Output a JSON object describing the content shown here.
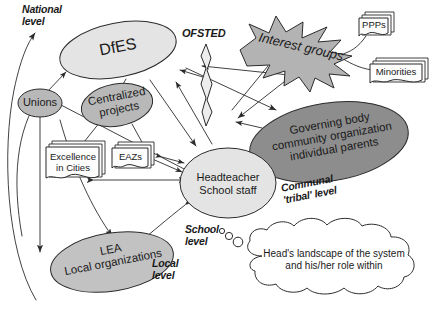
{
  "diagram": {
    "title": "Head's landscape of the system and his/her role within",
    "colors": {
      "stroke": "#2b2b2b",
      "light_fill": "#e3e3e3",
      "mid_fill": "#b8b8b8",
      "dark_fill": "#8d8d8d",
      "starburst_fill": "#b3b3b3",
      "paper_fill": "#fdfdfd",
      "background": "#ffffff",
      "text": "#1a1a1a"
    },
    "level_labels": [
      {
        "id": "national",
        "text": "National\nlevel"
      },
      {
        "id": "local",
        "text": "Local\nlevel"
      },
      {
        "id": "school",
        "text": "School\nlevel"
      },
      {
        "id": "communal",
        "text": "Communal\n'tribal' level"
      }
    ],
    "nodes": [
      {
        "id": "dfes",
        "shape": "ellipse",
        "label": "DfES",
        "fill": "light"
      },
      {
        "id": "ofsted",
        "shape": "lightning-label",
        "label": "OFSTED",
        "fill": "light"
      },
      {
        "id": "unions",
        "shape": "ellipse",
        "label": "Unions",
        "fill": "mid"
      },
      {
        "id": "centralized-projects",
        "shape": "ellipse",
        "label": "Centralized\nprojects",
        "fill": "mid"
      },
      {
        "id": "excellence-in-cities",
        "shape": "document-stack",
        "label": "Excellence\nin Cities",
        "fill": "paper"
      },
      {
        "id": "eazs",
        "shape": "document-stack",
        "label": "EAZs",
        "fill": "paper"
      },
      {
        "id": "interest-groups",
        "shape": "starburst",
        "label": "Interest groups",
        "fill": "starburst"
      },
      {
        "id": "ppps",
        "shape": "document-stack",
        "label": "PPPs",
        "fill": "paper"
      },
      {
        "id": "minorities",
        "shape": "document-stack",
        "label": "Minorities",
        "fill": "paper"
      },
      {
        "id": "governing-body",
        "shape": "ellipse",
        "label": "Governing body\ncommunity organization\nindividual parents",
        "fill": "dark"
      },
      {
        "id": "headteacher",
        "shape": "ellipse",
        "label": "Headteacher\nSchool staff",
        "fill": "light"
      },
      {
        "id": "lea",
        "shape": "ellipse",
        "label": "LEA\nLocal organizations",
        "fill": "mid"
      },
      {
        "id": "thought-cloud",
        "shape": "cloud",
        "label": "Head's landscape of the system\nand his/her role within",
        "fill": "paper"
      }
    ],
    "footer_strip": ""
  }
}
